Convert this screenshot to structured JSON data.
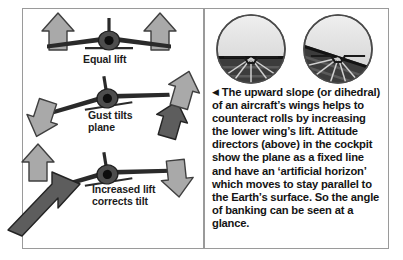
{
  "figure": {
    "type": "illustrated-diagram"
  },
  "left_panel": {
    "name": "dihedral-stability-diagram",
    "captions": [
      {
        "id": "equal-lift",
        "text": "Equal lift"
      },
      {
        "id": "gust-tilts",
        "text": "Gust tilts\nplane"
      },
      {
        "id": "increased-lift",
        "text": "Increased lift\ncorrects tilt"
      }
    ],
    "stages": [
      {
        "id": "stage-level",
        "label": "Equal lift",
        "aircraft_bank_deg": 0,
        "arrows": [
          {
            "id": "lift-arrow-left",
            "direction": "up",
            "tone": "light"
          },
          {
            "id": "lift-arrow-right",
            "direction": "up",
            "tone": "light"
          }
        ]
      },
      {
        "id": "stage-gust",
        "label": "Gust tilts plane",
        "aircraft_bank_deg": -9,
        "arrows": [
          {
            "id": "gust-arrow-up-right",
            "direction": "up",
            "tone": "dark"
          },
          {
            "id": "lift-arrow-up-right",
            "direction": "up",
            "tone": "light"
          },
          {
            "id": "gust-arrow-down-left",
            "direction": "down",
            "tone": "light"
          }
        ]
      },
      {
        "id": "stage-correction",
        "label": "Increased lift corrects tilt",
        "aircraft_bank_deg": -9,
        "arrows": [
          {
            "id": "correction-arrow-up-left",
            "direction": "up",
            "tone": "light"
          },
          {
            "id": "correction-arrow-diagonal",
            "direction": "up-right",
            "tone": "dark"
          },
          {
            "id": "correction-arrow-down-right",
            "direction": "down",
            "tone": "light"
          }
        ]
      }
    ]
  },
  "right_panel": {
    "instruments": {
      "name": "attitude-director-indicators",
      "items": [
        {
          "id": "adi-level",
          "label": "level flight",
          "horizon_bank_deg": 0
        },
        {
          "id": "adi-banked",
          "label": "banked flight",
          "horizon_bank_deg": 18
        }
      ]
    },
    "caption": {
      "bullet": "◀",
      "text": " The upward slope (or dihedral) of an aircraft’s wings helps to counteract rolls by increasing the lower wing’s lift. Attitude directors (above) in the cockpit show the plane as a fixed line and have an ‘artificial horizon’ which moves to stay parallel to the Earth’s surface. So the angle of banking can be seen at a glance."
    }
  },
  "colors": {
    "background": "#ffffff",
    "border": "#9a9a9a",
    "text": "#141414",
    "arrow_light": "#a9a9a9",
    "arrow_light_edge": "#4a4a4a",
    "arrow_dark": "#5d5d5d",
    "arrow_dark_edge": "#2b2b2b",
    "aircraft": "#2a2a2a",
    "sky": "#d8d8d8",
    "ground": "#3a3a3a"
  }
}
